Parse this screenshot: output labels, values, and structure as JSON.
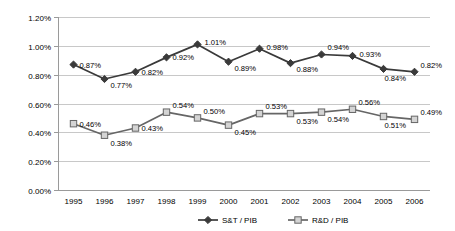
{
  "chart_data": {
    "type": "line",
    "title": "",
    "xlabel": "",
    "ylabel": "",
    "categories": [
      "1995",
      "1996",
      "1997",
      "1998",
      "1999",
      "2000",
      "2001",
      "2002",
      "2003",
      "2004",
      "2005",
      "2006"
    ],
    "ylim": [
      0.0,
      1.2
    ],
    "ytick_labels": [
      "0.00%",
      "0.20%",
      "0.40%",
      "0.60%",
      "0.80%",
      "1.00%",
      "1.20%"
    ],
    "ytick_values": [
      0.0,
      0.2,
      0.4,
      0.6,
      0.8,
      1.0,
      1.2
    ],
    "grid": true,
    "legend_position": "bottom",
    "series": [
      {
        "name": "S&T / PIB",
        "marker": "diamond",
        "color": "#3a3a3a",
        "values": [
          0.87,
          0.77,
          0.82,
          0.92,
          1.01,
          0.89,
          0.98,
          0.88,
          0.94,
          0.93,
          0.84,
          0.82
        ],
        "labels": [
          "0.87%",
          "0.77%",
          "0.82%",
          "0.92%",
          "1.01%",
          "0.89%",
          "0.98%",
          "0.88%",
          "0.94%",
          "0.93%",
          "0.84%",
          "0.82%"
        ]
      },
      {
        "name": "R&D / PIB",
        "marker": "square",
        "color": "#666666",
        "fill": "#d4d4d4",
        "values": [
          0.46,
          0.38,
          0.43,
          0.54,
          0.5,
          0.45,
          0.53,
          0.53,
          0.54,
          0.56,
          0.51,
          0.49
        ],
        "labels": [
          "0.46%",
          "0.38%",
          "0.43%",
          "0.54%",
          "0.50%",
          "0.45%",
          "0.53%",
          "0.53%",
          "0.54%",
          "0.56%",
          "0.51%",
          "0.49%"
        ]
      }
    ]
  },
  "legend": {
    "items": [
      {
        "label": "S&T / PIB"
      },
      {
        "label": "R&D / PIB"
      }
    ]
  }
}
